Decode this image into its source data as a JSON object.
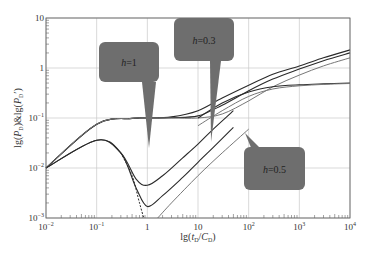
{
  "chart_data": {
    "type": "line",
    "title": "",
    "xlabel": "lg(t_D/C_D)",
    "ylabel": "lg(P_D)&lg(P_D')",
    "xscale": "log",
    "yscale": "log",
    "xlim": [
      0.01,
      10000
    ],
    "ylim": [
      0.001,
      10
    ],
    "grid": true,
    "x_ticks": [
      "10^-2",
      "10^-1",
      "1",
      "10",
      "10^2",
      "10^3",
      "10^4"
    ],
    "y_ticks": [
      "10^-3",
      "10^-2",
      "10^-1",
      "1",
      "10"
    ],
    "annotations": [
      {
        "text": "h=1",
        "points_to_x": 2.0,
        "points_to_y": 0.01
      },
      {
        "text": "h=0.3",
        "points_to_x": 1.8,
        "points_to_y": 0.004
      },
      {
        "text": "h=0.5",
        "points_to_x": 14,
        "points_to_y": 0.02
      }
    ],
    "series": [
      {
        "name": "pressure h=1",
        "style": "solid-dark",
        "x": [
          0.01,
          0.1,
          0.5,
          1,
          3,
          10,
          30,
          100,
          300,
          1000,
          3000,
          10000
        ],
        "y": [
          0.01,
          0.075,
          0.098,
          0.1,
          0.105,
          0.14,
          0.25,
          0.45,
          0.75,
          1.1,
          1.6,
          2.3
        ]
      },
      {
        "name": "pressure h=0.3",
        "style": "solid-dark",
        "x": [
          0.01,
          0.1,
          0.5,
          1,
          3,
          10,
          30,
          100,
          300,
          1000,
          3000,
          10000
        ],
        "y": [
          0.01,
          0.075,
          0.098,
          0.1,
          0.102,
          0.11,
          0.18,
          0.35,
          0.6,
          0.95,
          1.4,
          2.0
        ]
      },
      {
        "name": "pressure h=0.5",
        "style": "solid-gray",
        "x": [
          0.01,
          0.1,
          0.5,
          1,
          3,
          10,
          30,
          100,
          300,
          1000,
          3000,
          10000
        ],
        "y": [
          0.01,
          0.075,
          0.098,
          0.1,
          0.1,
          0.1,
          0.12,
          0.22,
          0.42,
          0.72,
          1.1,
          1.6
        ]
      },
      {
        "name": "derivative plateau A",
        "style": "solid-dark",
        "x": [
          10,
          30,
          100,
          300,
          1000,
          3000,
          10000
        ],
        "y": [
          0.1,
          0.2,
          0.33,
          0.42,
          0.46,
          0.48,
          0.5
        ]
      },
      {
        "name": "derivative plateau B",
        "style": "solid-gray",
        "x": [
          10,
          30,
          100,
          300,
          1000,
          3000,
          10000
        ],
        "y": [
          0.07,
          0.14,
          0.27,
          0.38,
          0.44,
          0.47,
          0.49
        ]
      },
      {
        "name": "derivative h=1",
        "style": "solid-dark",
        "x": [
          0.01,
          0.1,
          0.3,
          0.6,
          1,
          2,
          5,
          10,
          20,
          50
        ],
        "y": [
          0.01,
          0.036,
          0.02,
          0.006,
          0.0045,
          0.007,
          0.016,
          0.03,
          0.06,
          0.14
        ]
      },
      {
        "name": "derivative h=0.3",
        "style": "solid-dark",
        "x": [
          0.01,
          0.1,
          0.3,
          0.6,
          1,
          2,
          5,
          10,
          20,
          50
        ],
        "y": [
          0.01,
          0.036,
          0.02,
          0.004,
          0.0017,
          0.0028,
          0.0065,
          0.013,
          0.026,
          0.065
        ]
      },
      {
        "name": "derivative h=0 (dashed)",
        "style": "dashed-dark",
        "x": [
          0.3,
          0.5,
          0.7,
          0.85
        ],
        "y": [
          0.02,
          0.007,
          0.002,
          0.001
        ]
      },
      {
        "name": "derivative h=0.5",
        "style": "solid-gray",
        "x": [
          1.6,
          3,
          10,
          30,
          100
        ],
        "y": [
          0.001,
          0.002,
          0.007,
          0.02,
          0.06
        ]
      }
    ]
  }
}
